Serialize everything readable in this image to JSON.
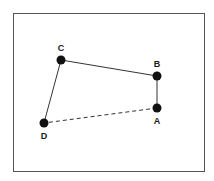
{
  "diagram": {
    "type": "quadrilateral-points",
    "frame": {
      "x": 13,
      "y": 13,
      "width": 191,
      "height": 158,
      "stroke": "#555555"
    },
    "points": [
      {
        "id": "A",
        "label": "A",
        "x": 157,
        "y": 108,
        "label_x": 157,
        "label_y": 124
      },
      {
        "id": "B",
        "label": "B",
        "x": 157,
        "y": 76,
        "label_x": 157,
        "label_y": 67
      },
      {
        "id": "C",
        "label": "C",
        "x": 61,
        "y": 60,
        "label_x": 61,
        "label_y": 51
      },
      {
        "id": "D",
        "label": "D",
        "x": 44,
        "y": 123,
        "label_x": 44,
        "label_y": 139
      }
    ],
    "edges": [
      {
        "from": "D",
        "to": "C",
        "style": "solid"
      },
      {
        "from": "C",
        "to": "B",
        "style": "solid"
      },
      {
        "from": "B",
        "to": "A",
        "style": "solid"
      },
      {
        "from": "A",
        "to": "D",
        "style": "dashed"
      }
    ],
    "colors": {
      "point": "#111111",
      "line": "#333333"
    }
  }
}
